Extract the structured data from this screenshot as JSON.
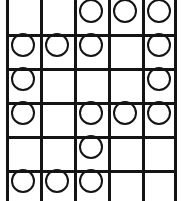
{
  "figure": {
    "kind": "circle-grid",
    "columns": 5,
    "rows": 6,
    "cell_size_px": 34,
    "circle_diameter_px": 24,
    "line_width_px": 2.5,
    "line_color": "#141414",
    "circle_stroke_color": "#141414",
    "circle_fill": "none",
    "background_color": "#ffffff",
    "cropping": "top row and bottom row are clipped by the image edges; left border inset ~6px",
    "filled_token": "O",
    "empty_token": ".",
    "grid": [
      [
        ".",
        ".",
        "O",
        "O",
        "O"
      ],
      [
        "O",
        "O",
        "O",
        ".",
        "O"
      ],
      [
        "O",
        ".",
        ".",
        ".",
        "O"
      ],
      [
        "O",
        ".",
        "O",
        "O",
        "O"
      ],
      [
        ".",
        ".",
        "O",
        ".",
        "."
      ],
      [
        "O",
        "O",
        "O",
        ".",
        "."
      ]
    ],
    "vertical_rule_x": [
      0,
      34,
      68,
      102,
      136,
      168
    ],
    "horizontal_rule_y": [
      40,
      74,
      108,
      142,
      176
    ]
  }
}
